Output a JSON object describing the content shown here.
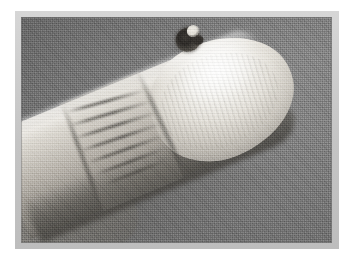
{
  "document": {
    "kind": "clinical-photograph",
    "caption": "",
    "has_text": false
  },
  "figure": {
    "title": "",
    "orientation": "finger angled from lower-left toward upper-right",
    "background_label": "plain gray studio backdrop"
  },
  "frame": {
    "outer_background_color": "#ffffff",
    "mount_color": "#c9c9c9",
    "photo_background_color": "#7d7d7d",
    "photo_left": 21,
    "photo_top": 17,
    "photo_width": 311,
    "photo_height": 226
  },
  "regions": [
    {
      "name": "finger-body",
      "label": "Finger shaft",
      "tone": "pale skin",
      "color": "#cfcbc3"
    },
    {
      "name": "finger-tip",
      "label": "Distal fingertip and nail",
      "tone": "bright highlight",
      "color": "#f8f7f3"
    },
    {
      "name": "lesion",
      "label": "Dark pigmented lesion",
      "tone": "dark",
      "color": "#2e2b28",
      "shape": "crescent"
    },
    {
      "name": "joint-crease",
      "label": "Interphalangeal joint creases",
      "tone": "mid",
      "color": "#8b8881"
    },
    {
      "name": "adjacent-digit",
      "label": "Adjacent digit at left edge",
      "tone": "bright",
      "color": "#f6f4ef"
    },
    {
      "name": "backdrop",
      "label": "Gray backdrop",
      "tone": "mid gray",
      "color": "#7d7d7d"
    }
  ],
  "texture": {
    "type": "halftone-dither",
    "note": "scanned print halftone screen visible across the entire photograph"
  }
}
